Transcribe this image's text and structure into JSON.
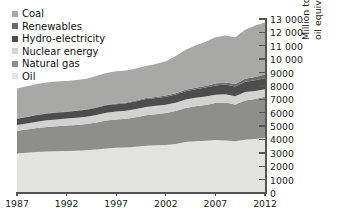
{
  "chart_data": {
    "type": "area",
    "stacked": true,
    "title": "",
    "xlabel": "",
    "ylabel": "Million tonnes oil equivalent",
    "ylabel_lines": [
      "Million tonnes",
      "oil equivalent"
    ],
    "xlim": [
      1987,
      2012
    ],
    "ylim": [
      0,
      13000
    ],
    "ytick_step": 1000,
    "grid": false,
    "legend_position": "top-left",
    "x": [
      1987,
      1988,
      1989,
      1990,
      1991,
      1992,
      1993,
      1994,
      1995,
      1996,
      1997,
      1998,
      1999,
      2000,
      2001,
      2002,
      2003,
      2004,
      2005,
      2006,
      2007,
      2008,
      2009,
      2010,
      2011,
      2012
    ],
    "xticks": [
      1987,
      1992,
      1997,
      2002,
      2007,
      2012
    ],
    "xtick_labels": [
      "1987",
      "1992",
      "1997",
      "2002",
      "2007",
      "2012"
    ],
    "yticks": [
      0,
      1000,
      2000,
      3000,
      4000,
      5000,
      6000,
      7000,
      8000,
      9000,
      10000,
      11000,
      12000,
      13000
    ],
    "ytick_labels": [
      "0",
      "1000",
      "2000",
      "3000",
      "4000",
      "5000",
      "6000",
      "7000",
      "8000",
      "9000",
      "10 000",
      "11 000",
      "12 000",
      "13 000"
    ],
    "stack_order_bottom_to_top": [
      "Oil",
      "Natural gas",
      "Nuclear energy",
      "Hydro-electricity",
      "Renewables",
      "Coal"
    ],
    "series": [
      {
        "name": "Oil",
        "color": "#e3e3e1",
        "values": [
          2960,
          3000,
          3060,
          3100,
          3110,
          3140,
          3150,
          3200,
          3250,
          3320,
          3380,
          3400,
          3460,
          3530,
          3560,
          3590,
          3670,
          3810,
          3870,
          3910,
          3960,
          3930,
          3870,
          3980,
          4030,
          4130
        ]
      },
      {
        "name": "Natural gas",
        "color": "#8e8e8c",
        "values": [
          1690,
          1740,
          1800,
          1840,
          1880,
          1900,
          1930,
          1950,
          2010,
          2090,
          2110,
          2140,
          2200,
          2280,
          2320,
          2380,
          2460,
          2540,
          2610,
          2670,
          2760,
          2830,
          2740,
          2930,
          3000,
          3060
        ]
      },
      {
        "name": "Nuclear energy",
        "color": "#d2d2d0",
        "values": [
          430,
          460,
          470,
          490,
          510,
          520,
          540,
          550,
          570,
          580,
          590,
          600,
          620,
          620,
          630,
          630,
          620,
          630,
          630,
          630,
          620,
          620,
          610,
          630,
          600,
          560
        ]
      },
      {
        "name": "Hydro-electricity",
        "color": "#4d4d4d",
        "values": [
          470,
          480,
          490,
          500,
          510,
          500,
          520,
          520,
          540,
          560,
          560,
          570,
          580,
          600,
          590,
          600,
          610,
          630,
          650,
          670,
          700,
          720,
          740,
          780,
          790,
          830
        ]
      },
      {
        "name": "Renewables",
        "color": "#6b6b69",
        "values": [
          20,
          22,
          24,
          26,
          28,
          30,
          33,
          36,
          40,
          44,
          48,
          53,
          58,
          64,
          70,
          78,
          86,
          96,
          108,
          122,
          140,
          160,
          180,
          210,
          240,
          280
        ]
      },
      {
        "name": "Coal",
        "color": "#a8a8a6",
        "values": [
          2240,
          2270,
          2300,
          2300,
          2290,
          2270,
          2270,
          2280,
          2330,
          2380,
          2410,
          2390,
          2380,
          2400,
          2470,
          2560,
          2790,
          2990,
          3150,
          3300,
          3460,
          3500,
          3500,
          3670,
          3850,
          3880
        ]
      }
    ],
    "totals": [
      7810,
      7972,
      8144,
      8256,
      8328,
      8360,
      8443,
      8536,
      8740,
      8974,
      9098,
      9153,
      9298,
      9494,
      9640,
      9838,
      10236,
      10696,
      11018,
      11302,
      11640,
      11760,
      11640,
      12200,
      12510,
      12740
    ]
  },
  "legend": {
    "items": [
      {
        "label": "Coal",
        "color": "#a8a8a6"
      },
      {
        "label": "Renewables",
        "color": "#6b6b69"
      },
      {
        "label": "Hydro-electricity",
        "color": "#4d4d4d"
      },
      {
        "label": "Nuclear energy",
        "color": "#d2d2d0"
      },
      {
        "label": "Natural gas",
        "color": "#8e8e8c"
      },
      {
        "label": "Oil",
        "color": "#e3e3e1"
      }
    ]
  },
  "axes": {
    "y_title_line1": "Million tonnes",
    "y_title_line2": "oil equivalent"
  }
}
